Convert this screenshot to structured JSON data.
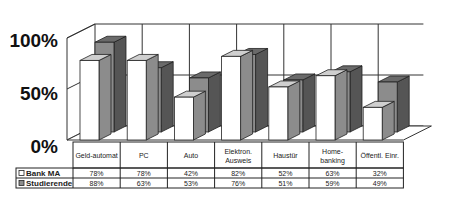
{
  "chart_data": {
    "type": "bar",
    "style": "3d-clustered-with-data-table",
    "title": "",
    "xlabel": "",
    "ylabel": "",
    "ylim": [
      0,
      100
    ],
    "yticks": [
      "0%",
      "50%",
      "100%"
    ],
    "grid": true,
    "categories": [
      "Geld-automat",
      "PC",
      "Auto",
      "Elektron. Ausweis",
      "Haustür",
      "Home-banking",
      "Öffentl. Einr."
    ],
    "category_lines": [
      [
        "Geld-automat"
      ],
      [
        "PC"
      ],
      [
        "Auto"
      ],
      [
        "Elektron.",
        "Ausweis"
      ],
      [
        "Haustür"
      ],
      [
        "Home-",
        "banking"
      ],
      [
        "Öffentl. Einr."
      ]
    ],
    "series": [
      {
        "name": "Bank MA",
        "values": [
          78,
          78,
          42,
          82,
          52,
          63,
          32
        ],
        "labels": [
          "78%",
          "78%",
          "42%",
          "82%",
          "52%",
          "63%",
          "32%"
        ],
        "color": "#ffffff"
      },
      {
        "name": "Studierende",
        "values": [
          88,
          63,
          53,
          76,
          51,
          59,
          49
        ],
        "labels": [
          "88%",
          "63%",
          "53%",
          "76%",
          "51%",
          "59%",
          "49%"
        ],
        "color": "#8c8c8c"
      }
    ],
    "legend": "in-data-table-left"
  }
}
